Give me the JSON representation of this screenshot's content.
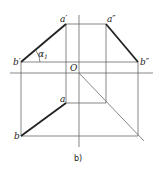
{
  "diagram": {
    "caption": "b)",
    "labels": {
      "a_prime": "a′",
      "a_double_prime": "a″",
      "b_prime": "b′",
      "b_double_prime": "b″",
      "origin": "O",
      "a": "a",
      "b": "b",
      "alpha": "α",
      "alpha_sub": "1"
    }
  }
}
